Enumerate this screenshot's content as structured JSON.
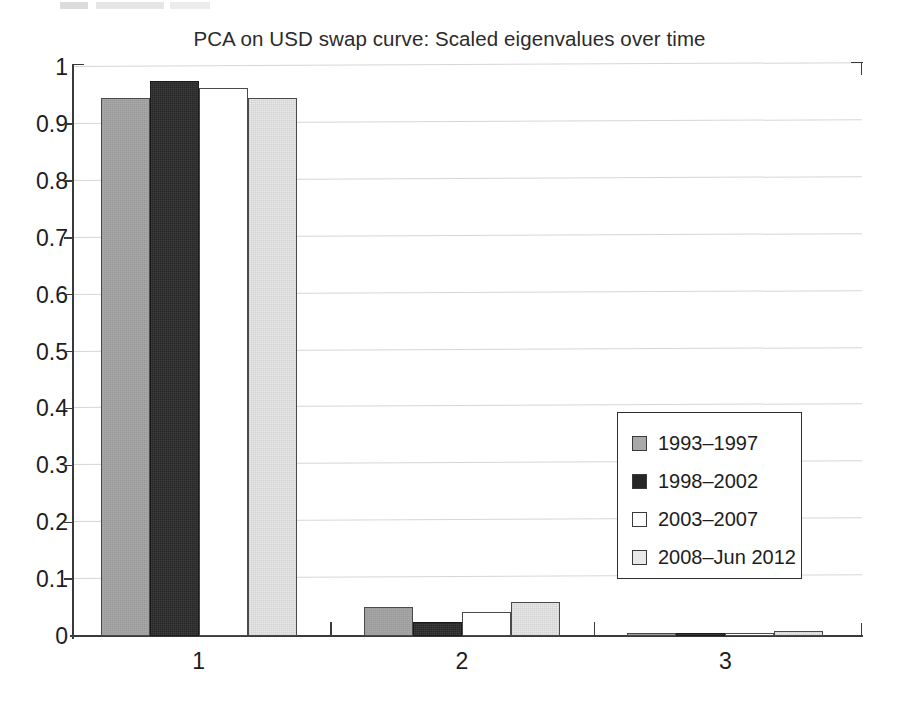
{
  "chart_data": {
    "type": "bar",
    "title": "PCA on USD swap curve: Scaled eigenvalues over time",
    "xlabel": "",
    "ylabel": "",
    "categories": [
      "1",
      "2",
      "3"
    ],
    "xtick_labels": [
      "1",
      "2",
      "3"
    ],
    "ytick_labels": [
      "0",
      "0.1",
      "0.2",
      "0.3",
      "0.4",
      "0.5",
      "0.6",
      "0.7",
      "0.8",
      "0.9",
      "1"
    ],
    "ytick_values": [
      0,
      0.1,
      0.2,
      0.3,
      0.4,
      0.5,
      0.6,
      0.7,
      0.8,
      0.9,
      1
    ],
    "ylim": [
      0,
      1
    ],
    "grid": true,
    "grid_axis": "y",
    "legend_position": "center-right",
    "series": [
      {
        "name": "1993–1997",
        "color": "#a9a9a9",
        "values": [
          0.945,
          0.051,
          0.006
        ]
      },
      {
        "name": "1998–2002",
        "color": "#262626",
        "values": [
          0.975,
          0.024,
          0.005
        ]
      },
      {
        "name": "2003–2007",
        "color": "#ffffff",
        "values": [
          0.963,
          0.042,
          0.006
        ]
      },
      {
        "name": "2008–Jun 2012",
        "color": "#e8e8e8",
        "values": [
          0.945,
          0.06,
          0.009
        ]
      }
    ]
  },
  "legend": {
    "items": [
      {
        "label": "1993–1997"
      },
      {
        "label": "1998–2002"
      },
      {
        "label": "2003–2007"
      },
      {
        "label": "2008–Jun 2012"
      }
    ]
  }
}
